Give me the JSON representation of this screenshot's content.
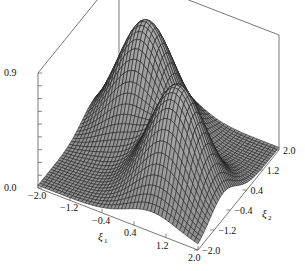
{
  "chart_data": {
    "type": "surface3d",
    "title": "",
    "xlabel": "ξ1",
    "ylabel": "ξ2",
    "zlabel": "",
    "x_ticks": [
      "-2.0",
      "-1.2",
      "-0.4",
      "0.4",
      "1.2",
      "2.0"
    ],
    "y_ticks": [
      "-2.0",
      "-1.2",
      "-0.4",
      "0.4",
      "1.2",
      "2.0"
    ],
    "z_ticks": [
      "0.0",
      "0.9"
    ],
    "xlim": [
      -2.0,
      2.0
    ],
    "ylim": [
      -2.0,
      2.0
    ],
    "zlim": [
      0.0,
      0.9
    ],
    "peaks": [
      {
        "xi1": -0.8,
        "xi2": 0.8,
        "z": 0.9
      },
      {
        "xi1": 0.8,
        "xi2": -0.8,
        "z": 0.9
      }
    ],
    "grid": false,
    "box": true,
    "surface_color": "#8a8a8a",
    "mesh_color": "#1a1a1a"
  },
  "labels": {
    "z_top": "0.9",
    "z_bottom": "0.0",
    "xi1_main": "ξ",
    "xi1_sub": "1",
    "xi2_main": "ξ",
    "xi2_sub": "2",
    "x_ticks": [
      "-2.0",
      "-1.2",
      "-0.4",
      "0.4",
      "1.2",
      "2.0"
    ],
    "y_ticks": [
      "-2.0",
      "-1.2",
      "-0.4",
      "0.4",
      "1.2",
      "2.0"
    ]
  }
}
